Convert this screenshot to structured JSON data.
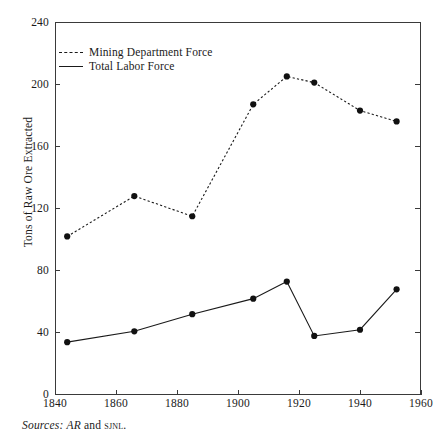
{
  "figure": {
    "title": "",
    "source_note": {
      "label": "Sources:",
      "ref1": "AR",
      "conjunction": "and",
      "ref2": "sjnl",
      "terminator": "."
    }
  },
  "legend": {
    "position": "top-left-inside",
    "entries": [
      {
        "label": "Mining Department Force",
        "style": "dashed",
        "marker": "filled-circle"
      },
      {
        "label": "Total Labor Force",
        "style": "solid",
        "marker": "filled-circle"
      }
    ]
  },
  "axes": {
    "y": {
      "title": "Tons of Raw Ore Extracted",
      "ticks": [
        "0",
        "40",
        "80",
        "120",
        "160",
        "200",
        "240"
      ],
      "min": 0,
      "max": 240
    },
    "x": {
      "title": "",
      "ticks": [
        "1840",
        "1860",
        "1880",
        "1900",
        "1920",
        "1940",
        "1960"
      ],
      "min": 1840,
      "max": 1960
    }
  },
  "chart_data": {
    "type": "line",
    "title": "",
    "xlabel": "",
    "ylabel": "Tons of Raw Ore Extracted",
    "xlim": [
      1840,
      1960
    ],
    "ylim": [
      0,
      240
    ],
    "grid": false,
    "legend_position": "upper left (inside axes)",
    "x": [
      1844,
      1866,
      1885,
      1905,
      1916,
      1925,
      1940,
      1952
    ],
    "series": [
      {
        "name": "Mining Department Force",
        "style": "dashed",
        "marker": "filled-circle",
        "x": [
          1844,
          1866,
          1885,
          1905,
          1916,
          1925,
          1940,
          1952
        ],
        "values": [
          102,
          128,
          115,
          187,
          205,
          201,
          183,
          176
        ]
      },
      {
        "name": "Total Labor Force",
        "style": "solid",
        "marker": "filled-circle",
        "x": [
          1844,
          1866,
          1885,
          1905,
          1916,
          1925,
          1940,
          1952
        ],
        "values": [
          34,
          41,
          52,
          62,
          73,
          38,
          42,
          68
        ]
      }
    ]
  }
}
